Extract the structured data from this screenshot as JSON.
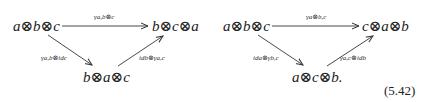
{
  "equation_number": "(5.42)",
  "diagrams": [
    {
      "nodes": {
        "source": "a⊗b⊗c",
        "target": "b⊗c⊗a",
        "middle": "b⊗a⊗c"
      },
      "arrows": {
        "top": "γa,b⊗c",
        "left": "γa,b⊗idc",
        "right": "idb⊗γa,c"
      }
    },
    {
      "nodes": {
        "source": "a⊗b⊗c",
        "target": "c⊗a⊗b",
        "middle": "a⊗c⊗b."
      },
      "arrows": {
        "top": "γa⊗b,c",
        "left": "ida⊗γb,c",
        "right": "γa,c⊗idb"
      }
    }
  ]
}
